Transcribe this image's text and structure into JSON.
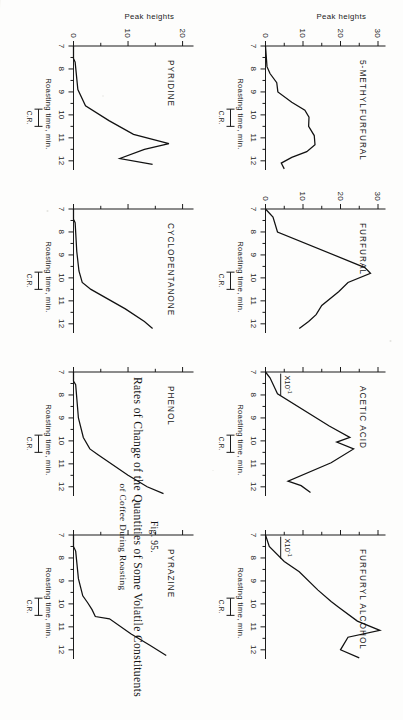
{
  "figure": {
    "number": "Fig. 95.",
    "caption_line1": "Rates of Change of the Quantities of Some Volatile Constituents",
    "caption_line2": "of Coffee During Roasting"
  },
  "axes": {
    "x_title": "Roasting time, min.",
    "y_title": "Peak heights",
    "x_ticks": [
      "7",
      "8",
      "9",
      "10",
      "11",
      "12"
    ],
    "x_min": 7,
    "x_max": 12.4,
    "cr_label": "C.R.",
    "cr_start": 9.75,
    "cr_end": 10.5,
    "multiplier_label": "X10",
    "multiplier_exp": "-1"
  },
  "chart_data": {
    "type": "line",
    "title": "Rates of Change of the Quantities of Some Volatile Constituents of Coffee During Roasting",
    "xlabel": "Roasting time, min.",
    "ylabel": "Peak heights",
    "xlim": [
      7,
      12.4
    ],
    "grid": false,
    "legend": "none",
    "shared_x_ticks": [
      7,
      8,
      9,
      10,
      11,
      12
    ],
    "annotation": "C.R. bracket marks the critical roast interval, approx. 9.75-10.5 min",
    "panels": [
      {
        "name": "5-METHYLFURFURAL",
        "row": 0,
        "column": 0,
        "ylim": [
          0,
          32
        ],
        "y_ticks": [
          0,
          10,
          20,
          30
        ],
        "y_tick_labels": [
          "0",
          "10",
          "20",
          "30"
        ],
        "y_minor_ticks": [
          5,
          15,
          25
        ],
        "multiplier": null,
        "x": [
          7.0,
          7.9,
          8.2,
          8.6,
          9.0,
          9.45,
          9.8,
          10.1,
          10.5,
          10.9,
          11.3,
          11.6,
          11.85,
          12.1,
          12.35
        ],
        "y": [
          0.0,
          0.4,
          1.2,
          3.0,
          3.3,
          7.0,
          10.5,
          11.6,
          11.5,
          13.0,
          13.2,
          11.0,
          7.0,
          4.2,
          5.0
        ]
      },
      {
        "name": "FURFURAL",
        "row": 0,
        "column": 1,
        "ylim": [
          0,
          32
        ],
        "y_ticks": [
          0,
          10,
          20,
          30
        ],
        "y_tick_labels": [
          "0",
          "10",
          "20",
          "30"
        ],
        "y_minor_ticks": [
          5,
          15,
          25
        ],
        "multiplier": null,
        "x": [
          7.0,
          7.35,
          8.0,
          9.55,
          9.8,
          10.2,
          10.6,
          11.2,
          11.6,
          11.9,
          12.2
        ],
        "y": [
          0.0,
          2.0,
          3.2,
          26.5,
          28.0,
          22.0,
          19.5,
          15.0,
          13.5,
          11.5,
          9.0
        ]
      },
      {
        "name": "ACETIC ACID",
        "row": 0,
        "column": 2,
        "ylim": [
          0,
          32
        ],
        "y_ticks": [
          0,
          10,
          20,
          30
        ],
        "y_tick_labels": [
          "",
          "",
          "",
          ""
        ],
        "y_minor_ticks": [
          5,
          15,
          25
        ],
        "multiplier": "X10-1",
        "x": [
          7.0,
          7.25,
          7.95,
          9.35,
          9.85,
          10.05,
          10.35,
          10.95,
          11.75,
          11.95,
          12.25
        ],
        "y": [
          0.0,
          1.2,
          3.2,
          17.0,
          22.5,
          19.0,
          23.5,
          17.5,
          6.0,
          9.5,
          12.0
        ]
      },
      {
        "name": "FURFURYL ALCOHOL",
        "row": 0,
        "column": 3,
        "ylim": [
          0,
          32
        ],
        "y_ticks": [
          0,
          10,
          20,
          30
        ],
        "y_tick_labels": [
          "",
          "",
          "",
          ""
        ],
        "y_minor_ticks": [
          5,
          15,
          25
        ],
        "multiplier": "X10-1",
        "x": [
          7.0,
          7.5,
          8.15,
          8.6,
          9.4,
          9.9,
          10.15,
          10.75,
          11.15,
          11.45,
          12.0,
          12.35
        ],
        "y": [
          0.0,
          1.0,
          5.0,
          9.0,
          14.0,
          17.5,
          19.5,
          24.5,
          30.5,
          22.0,
          20.0,
          25.0
        ]
      },
      {
        "name": "PYRIDINE",
        "row": 1,
        "column": 0,
        "ylim": [
          0,
          22
        ],
        "y_ticks": [
          0,
          10,
          20
        ],
        "y_tick_labels": [
          "0",
          "10",
          "20"
        ],
        "y_minor_ticks": [
          5,
          15
        ],
        "multiplier": null,
        "x": [
          7.0,
          7.55,
          7.7,
          8.9,
          9.6,
          10.25,
          10.85,
          11.25,
          11.5,
          11.9,
          12.15
        ],
        "y": [
          0.0,
          0.0,
          0.3,
          0.8,
          2.2,
          6.5,
          11.0,
          17.5,
          13.0,
          8.5,
          14.5
        ]
      },
      {
        "name": "CYCLOPENTANONE",
        "row": 1,
        "column": 1,
        "ylim": [
          0,
          22
        ],
        "y_ticks": [
          0,
          10,
          20
        ],
        "y_tick_labels": [
          "",
          "",
          ""
        ],
        "y_minor_ticks": [
          5,
          15
        ],
        "multiplier": null,
        "x": [
          7.0,
          7.45,
          7.6,
          8.85,
          9.7,
          10.2,
          10.5,
          11.35,
          11.9,
          12.2
        ],
        "y": [
          0.0,
          0.0,
          0.3,
          0.6,
          1.0,
          1.6,
          3.2,
          9.5,
          13.0,
          14.5
        ]
      },
      {
        "name": "PHENOL",
        "row": 1,
        "column": 2,
        "ylim": [
          0,
          22
        ],
        "y_ticks": [
          0,
          10,
          20
        ],
        "y_tick_labels": [
          "",
          "",
          ""
        ],
        "y_minor_ticks": [
          5,
          15
        ],
        "multiplier": null,
        "x": [
          7.0,
          7.4,
          7.55,
          9.0,
          9.85,
          10.35,
          10.6,
          11.5,
          12.0,
          12.3
        ],
        "y": [
          0.0,
          0.0,
          0.4,
          0.9,
          1.8,
          3.0,
          4.5,
          10.0,
          13.5,
          16.5
        ]
      },
      {
        "name": "PYRAZINE",
        "row": 1,
        "column": 3,
        "ylim": [
          0,
          22
        ],
        "y_ticks": [
          0,
          10,
          20
        ],
        "y_tick_labels": [
          "",
          "",
          ""
        ],
        "y_minor_ticks": [
          5,
          15
        ],
        "multiplier": null,
        "x": [
          7.0,
          7.5,
          7.7,
          8.9,
          9.65,
          9.95,
          10.25,
          10.55,
          10.65,
          11.3,
          11.8,
          12.25
        ],
        "y": [
          0.0,
          0.0,
          0.4,
          0.9,
          1.7,
          2.6,
          3.4,
          4.0,
          6.6,
          10.5,
          14.0,
          17.0
        ]
      }
    ]
  }
}
